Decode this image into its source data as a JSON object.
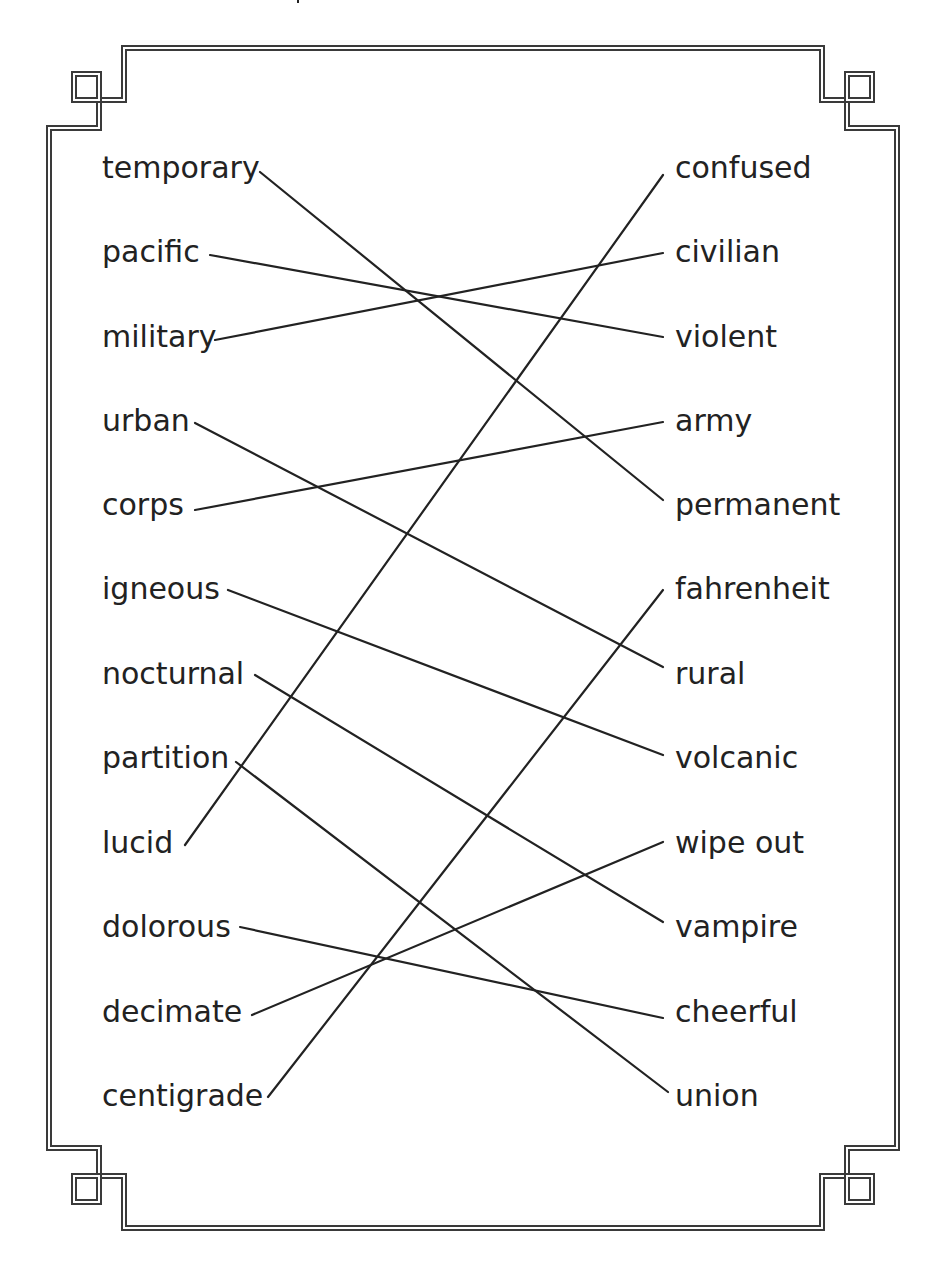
{
  "worksheet": {
    "type": "matching-worksheet",
    "left_column": [
      "temporary",
      "pacific",
      "military",
      "urban",
      "corps",
      "igneous",
      "nocturnal",
      "partition",
      "lucid",
      "dolorous",
      "decimate",
      "centigrade"
    ],
    "right_column": [
      "confused",
      "civilian",
      "violent",
      "army",
      "permanent",
      "fahrenheit",
      "rural",
      "volcanic",
      "wipe out",
      "vampire",
      "cheerful",
      "union"
    ],
    "matches": [
      {
        "left": "temporary",
        "right": "permanent"
      },
      {
        "left": "pacific",
        "right": "violent"
      },
      {
        "left": "military",
        "right": "civilian"
      },
      {
        "left": "urban",
        "right": "rural"
      },
      {
        "left": "corps",
        "right": "army"
      },
      {
        "left": "igneous",
        "right": "volcanic"
      },
      {
        "left": "nocturnal",
        "right": "vampire"
      },
      {
        "left": "partition",
        "right": "union"
      },
      {
        "left": "lucid",
        "right": "confused"
      },
      {
        "left": "dolorous",
        "right": "cheerful"
      },
      {
        "left": "decimate",
        "right": "wipe out"
      },
      {
        "left": "centigrade",
        "right": "fahrenheit"
      }
    ],
    "colors": {
      "ink": "#222222",
      "frame": "#3a3a3a",
      "background": "#ffffff"
    }
  }
}
